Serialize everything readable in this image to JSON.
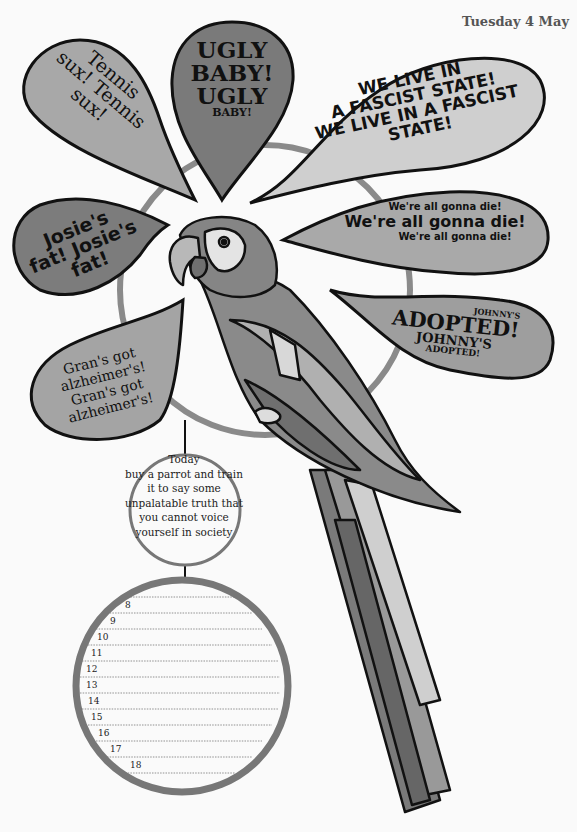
{
  "header": {
    "date": "Tuesday 4 May"
  },
  "bubbles": {
    "tennis": {
      "lines": [
        "Tennis",
        "sux! Tennis",
        "sux!"
      ]
    },
    "ugly_baby": {
      "lines": [
        "UGLY",
        "BABY!",
        "UGLY",
        "BABY!"
      ]
    },
    "fascist": {
      "lines": [
        "WE LIVE IN",
        "A FASCIST STATE!",
        "WE LIVE IN A FASCIST",
        "STATE!"
      ]
    },
    "josie": {
      "lines": [
        "Josie's",
        "fat! Josie's",
        "fat!"
      ]
    },
    "gonna_die": {
      "lines": [
        "We're all gonna die!",
        "We're all gonna die!",
        "We're all gonna die!"
      ]
    },
    "johnny": {
      "lines": [
        "JOHNNY'S",
        "ADOPTED!",
        "JOHNNY'S",
        "ADOPTED!"
      ]
    },
    "gran": {
      "lines": [
        "Gran's got",
        "alzheimer's!",
        "Gran's got",
        "alzheimer's!"
      ]
    }
  },
  "tip": {
    "title": "Today",
    "body": "buy a parrot and train it to say some unpalatable truth that you cannot voice yourself in society"
  },
  "planner": {
    "hours": [
      "8",
      "9",
      "10",
      "11",
      "12",
      "13",
      "14",
      "15",
      "16",
      "17",
      "18"
    ]
  },
  "colors": {
    "outline": "#111111",
    "ring": "#7a7a7a",
    "bubble_light": "#c8c8c8",
    "bubble_mid": "#9a9a9a",
    "bubble_dark": "#6e6e6e"
  }
}
